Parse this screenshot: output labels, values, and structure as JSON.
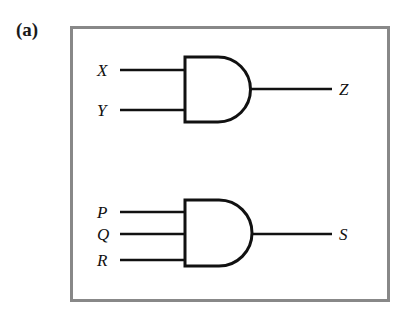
{
  "figure": {
    "part_label": "(a)",
    "background_color": "#ffffff",
    "frame_color": "#888888",
    "wire_color": "#111111",
    "gate_outline_color": "#111111",
    "width": 415,
    "height": 319
  },
  "diagram_data": {
    "type": "logic-circuit-schematic",
    "notation": "distinctive-shape (ANSI/IEEE 91)",
    "gates": [
      {
        "id": "gate-1",
        "gate_type": "AND",
        "input_count": 2,
        "inputs": [
          "X",
          "Y"
        ],
        "output": "Z",
        "expression": "Z = X AND Y",
        "body": {
          "left": 115,
          "top": 31,
          "right": 180,
          "bottom": 96
        }
      },
      {
        "id": "gate-2",
        "gate_type": "AND",
        "input_count": 3,
        "inputs": [
          "P",
          "Q",
          "R"
        ],
        "output": "S",
        "expression": "S = P AND Q AND R",
        "body": {
          "left": 115,
          "top": 174,
          "right": 182,
          "bottom": 240
        }
      }
    ],
    "signals": [
      {
        "name": "X",
        "role": "input",
        "gate": "gate-1",
        "label_x": 27,
        "label_y": 37,
        "wire_y": 44
      },
      {
        "name": "Y",
        "role": "input",
        "gate": "gate-1",
        "label_x": 27,
        "label_y": 77,
        "wire_y": 84
      },
      {
        "name": "Z",
        "role": "output",
        "gate": "gate-1",
        "label_x": 270,
        "label_y": 56,
        "wire_y": 63
      },
      {
        "name": "P",
        "role": "input",
        "gate": "gate-2",
        "label_x": 27,
        "label_y": 179,
        "wire_y": 186
      },
      {
        "name": "Q",
        "role": "input",
        "gate": "gate-2",
        "label_x": 27,
        "label_y": 201,
        "wire_y": 208
      },
      {
        "name": "R",
        "role": "input",
        "gate": "gate-2",
        "label_x": 27,
        "label_y": 227,
        "wire_y": 234
      },
      {
        "name": "S",
        "role": "output",
        "gate": "gate-2",
        "label_x": 270,
        "label_y": 201,
        "wire_y": 208
      }
    ]
  },
  "labels": {
    "x_input": "X",
    "y_input": "Y",
    "z_output": "Z",
    "p_input": "P",
    "q_input": "Q",
    "r_input": "R",
    "s_output": "S"
  }
}
